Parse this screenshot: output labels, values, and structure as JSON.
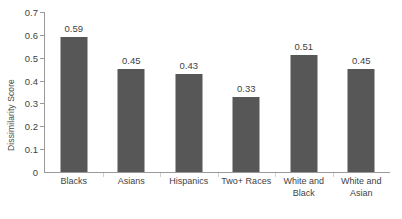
{
  "chart_data": {
    "type": "bar",
    "title": "",
    "xlabel": "",
    "ylabel": "Dissimilarity Score",
    "ylim": [
      0,
      0.7
    ],
    "grid": false,
    "legend": false,
    "bar_color": "#575757",
    "axis_color": "#9a9a9a",
    "categories": [
      "Blacks",
      "Asians",
      "Hispanics",
      "Two+ Races",
      "White and Black",
      "White and Asian"
    ],
    "category_lines": [
      [
        "Blacks"
      ],
      [
        "Asians"
      ],
      [
        "Hispanics"
      ],
      [
        "Two+ Races"
      ],
      [
        "White and",
        "Black"
      ],
      [
        "White and",
        "Asian"
      ]
    ],
    "values": [
      0.59,
      0.45,
      0.43,
      0.33,
      0.51,
      0.45
    ],
    "value_labels": [
      "0.59",
      "0.45",
      "0.43",
      "0.33",
      "0.51",
      "0.45"
    ],
    "yticks": [
      0,
      0.1,
      0.2,
      0.3,
      0.4,
      0.5,
      0.6,
      0.7
    ],
    "ytick_labels": [
      "0",
      "0.1",
      "0.2",
      "0.3",
      "0.4",
      "0.5",
      "0.6",
      "0.7"
    ]
  }
}
